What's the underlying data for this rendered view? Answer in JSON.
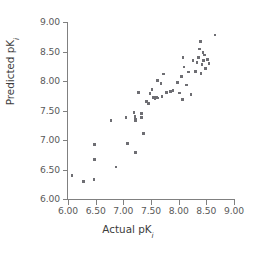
{
  "chart_data": {
    "type": "scatter",
    "title": "",
    "xlabel": "Actual pK",
    "xlabel_sub": "i",
    "ylabel": "Predicted pK",
    "ylabel_sub": "i",
    "xlim": [
      6.0,
      9.0
    ],
    "ylim": [
      6.0,
      9.0
    ],
    "xticks": [
      6.0,
      6.5,
      7.0,
      7.5,
      8.0,
      8.5,
      9.0
    ],
    "yticks": [
      6.0,
      6.5,
      7.0,
      7.5,
      8.0,
      8.5,
      9.0
    ],
    "xticklabels": [
      "6.00",
      "6.50",
      "7.00",
      "7.50",
      "8.00",
      "8.50",
      "9.00"
    ],
    "yticklabels": [
      "6.00",
      "6.50",
      "7.00",
      "7.50",
      "8.00",
      "8.50",
      "9.00"
    ],
    "grid": false,
    "legend": false,
    "marker": "square",
    "marker_color": "#6e6e73",
    "axis_color": "#808080",
    "tick_label_color": "#5a5a5a",
    "axis_label_color": "#3c3c3c",
    "n_points": 57,
    "points": [
      [
        6.07,
        6.4
      ],
      [
        6.28,
        6.3
      ],
      [
        6.47,
        6.33
      ],
      [
        6.48,
        6.92
      ],
      [
        6.48,
        6.67
      ],
      [
        6.78,
        7.33
      ],
      [
        6.87,
        6.54
      ],
      [
        7.05,
        7.38
      ],
      [
        7.08,
        6.94
      ],
      [
        7.19,
        7.47
      ],
      [
        7.21,
        7.4
      ],
      [
        7.22,
        7.35
      ],
      [
        7.22,
        7.33
      ],
      [
        7.22,
        6.79
      ],
      [
        7.27,
        7.81
      ],
      [
        7.33,
        7.45
      ],
      [
        7.36,
        7.11
      ],
      [
        7.42,
        7.65
      ],
      [
        7.45,
        7.62
      ],
      [
        7.52,
        7.86
      ],
      [
        7.55,
        7.72
      ],
      [
        7.57,
        7.7
      ],
      [
        7.6,
        7.72
      ],
      [
        7.62,
        7.71
      ],
      [
        7.68,
        7.96
      ],
      [
        7.7,
        7.74
      ],
      [
        7.73,
        8.12
      ],
      [
        7.78,
        7.81
      ],
      [
        7.85,
        7.82
      ],
      [
        8.02,
        7.8
      ],
      [
        8.05,
        8.08
      ],
      [
        8.07,
        7.69
      ],
      [
        8.08,
        8.4
      ],
      [
        8.14,
        7.93
      ],
      [
        8.18,
        8.15
      ],
      [
        8.22,
        7.77
      ],
      [
        8.3,
        8.16
      ],
      [
        8.33,
        8.31
      ],
      [
        8.36,
        8.4
      ],
      [
        8.38,
        8.54
      ],
      [
        8.39,
        8.67
      ],
      [
        8.42,
        8.28
      ],
      [
        8.44,
        8.48
      ],
      [
        8.45,
        8.35
      ],
      [
        8.47,
        8.44
      ],
      [
        8.48,
        8.21
      ],
      [
        8.52,
        8.36
      ],
      [
        8.66,
        8.78
      ],
      [
        7.48,
        7.79
      ],
      [
        7.62,
        8.01
      ],
      [
        8.1,
        8.24
      ],
      [
        8.26,
        8.35
      ],
      [
        7.9,
        7.84
      ],
      [
        7.33,
        7.38
      ],
      [
        7.98,
        7.97
      ],
      [
        8.4,
        8.13
      ],
      [
        8.55,
        8.3
      ]
    ]
  }
}
